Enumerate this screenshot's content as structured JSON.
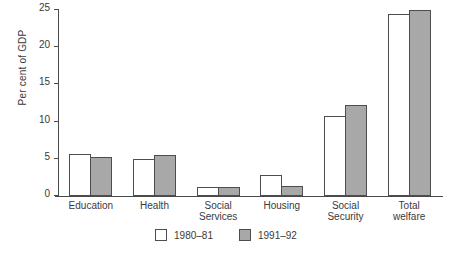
{
  "chart_data": {
    "type": "bar",
    "title": "",
    "xlabel": "",
    "ylabel": "Per cent of GDP",
    "ylim": [
      0,
      25
    ],
    "yticks": [
      0,
      5,
      10,
      15,
      20,
      25
    ],
    "grid": false,
    "legend_position": "bottom-center",
    "categories": [
      "Education",
      "Health",
      "Social Services",
      "Housing",
      "Social Security",
      "Total welfare"
    ],
    "category_lines": [
      [
        "Education"
      ],
      [
        "Health"
      ],
      [
        "Social",
        "Services"
      ],
      [
        "Housing"
      ],
      [
        "Social",
        "Security"
      ],
      [
        "Total",
        "welfare"
      ]
    ],
    "series": [
      {
        "name": "1980–81",
        "color": "#ffffff",
        "values": [
          5.7,
          5.0,
          1.2,
          2.8,
          10.8,
          24.5
        ]
      },
      {
        "name": "1991–92",
        "color": "#a8a8a8",
        "values": [
          5.2,
          5.5,
          1.2,
          1.3,
          12.3,
          25.0
        ]
      }
    ]
  },
  "legend": {
    "items": [
      {
        "label": "1980–81",
        "swatch": "white"
      },
      {
        "label": "1991–92",
        "swatch": "grey"
      }
    ]
  },
  "colors": {
    "axis": "#4a4a4a",
    "bar_outline": "#4d4d4d",
    "series_1980": "#ffffff",
    "series_1991": "#a8a8a8",
    "text": "#3a3a3a",
    "background": "#ffffff"
  }
}
